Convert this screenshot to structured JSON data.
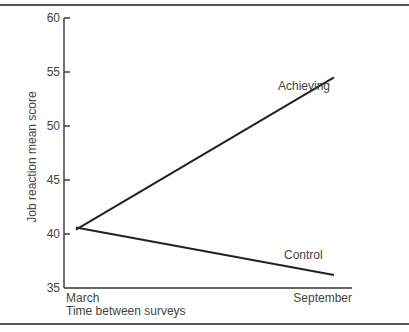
{
  "chart_data": {
    "type": "line",
    "title": "",
    "xlabel": "Time between surveys",
    "ylabel": "Job reaction mean score",
    "categories": [
      "March",
      "September"
    ],
    "series": [
      {
        "name": "Achieving",
        "values": [
          40.4,
          54.5
        ]
      },
      {
        "name": "Control",
        "values": [
          40.6,
          36.2
        ]
      }
    ],
    "ylim": [
      35,
      60
    ],
    "yticks": [
      35,
      40,
      45,
      50,
      55,
      60
    ],
    "grid": false,
    "legend": "inline labels near line ends",
    "line_color": "#222222"
  }
}
